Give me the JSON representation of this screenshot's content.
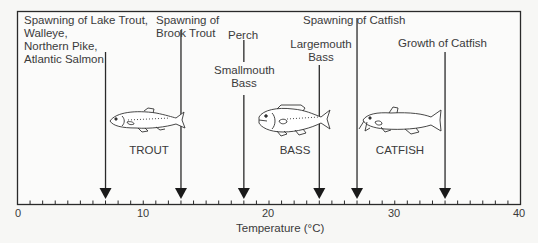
{
  "chart_data": {
    "type": "annotated-axis",
    "title": "",
    "xlabel": "Temperature (°C)",
    "ylabel": "",
    "xlim": [
      0,
      40
    ],
    "x_ticks_major": [
      0,
      10,
      20,
      30,
      40
    ],
    "x_ticks_minor_step": 1,
    "grid": false,
    "markers": [
      {
        "label": "Spawning of Lake Trout, Walleye, Northern Pike, Atlantic Salmon",
        "lines": [
          "Spawning of Lake Trout,",
          "Walleye,",
          "Northern Pike,",
          "Atlantic Salmon"
        ],
        "x": 7
      },
      {
        "label": "Spawning of Brook Trout",
        "lines": [
          "Spawning of",
          "Brook Trout"
        ],
        "x": 13
      },
      {
        "label": "Perch / Smallmouth Bass",
        "lines": [
          "Perch"
        ],
        "lines2": [
          "Smallmouth",
          "Bass"
        ],
        "x": 18
      },
      {
        "label": "Largemouth Bass",
        "lines": [
          "Largemouth",
          "Bass"
        ],
        "x": 24
      },
      {
        "label": "Spawning of Catfish",
        "lines": [
          "Spawning of Catfish"
        ],
        "x": 27
      },
      {
        "label": "Growth of Catfish",
        "lines": [
          "Growth of Catfish"
        ],
        "x": 34
      }
    ],
    "fish_illustrations": [
      {
        "name": "TROUT",
        "x_center": 10
      },
      {
        "name": "BASS",
        "x_center": 21
      },
      {
        "name": "CATFISH",
        "x_center": 30.5
      }
    ]
  },
  "labels": {
    "m0": [
      "Spawning of Lake Trout,",
      "Walleye,",
      "Northern Pike,",
      "Atlantic Salmon"
    ],
    "m1": [
      "Spawning of",
      "Brook Trout"
    ],
    "m2a": "Perch",
    "m2b": [
      "Smallmouth",
      "Bass"
    ],
    "m3": [
      "Largemouth",
      "Bass"
    ],
    "m4": "Spawning of Catfish",
    "m5": "Growth of Catfish",
    "fish": [
      "TROUT",
      "BASS",
      "CATFISH"
    ],
    "ticks": [
      "0",
      "10",
      "20",
      "30",
      "40"
    ],
    "xlabel": "Temperature (°C)"
  },
  "colors": {
    "line": "#2a2a2a",
    "text": "#3a3a3a",
    "background": "#f7f7f5"
  }
}
